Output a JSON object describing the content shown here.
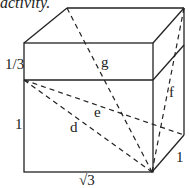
{
  "caption": "activity.",
  "figure": {
    "type": "rectangular box with space diagonals",
    "dimensions": {
      "width": "√3",
      "depth": "1",
      "height": "1",
      "extra_height": "1/3"
    },
    "labels": {
      "top_section": "1/3",
      "height": "1",
      "width": "√3",
      "depth": "1",
      "d": "d",
      "e": "e",
      "f": "f",
      "g": "g"
    },
    "line_color": "#222222"
  }
}
